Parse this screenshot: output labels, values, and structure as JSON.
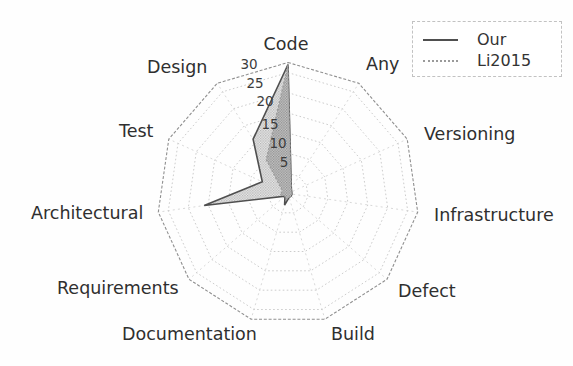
{
  "figure": {
    "background": "#fefefe"
  },
  "legend": {
    "items": [
      {
        "label": "Our",
        "line_style": "solid"
      },
      {
        "label": "Li2015",
        "line_style": "dotted"
      }
    ]
  },
  "chart_data": {
    "type": "radar",
    "title": "",
    "categories": [
      "Code",
      "Any",
      "Versioning",
      "Infrastructure",
      "Defect",
      "Build",
      "Documentation",
      "Requirements",
      "Architectural",
      "Test",
      "Design"
    ],
    "direction": "clockwise",
    "start_angle_deg": 90,
    "radial_ticks": [
      5,
      10,
      15,
      20,
      25,
      30
    ],
    "rmax": 32.5,
    "grid": true,
    "legend_position": "upper right",
    "series": [
      {
        "name": "Our",
        "style": "solid",
        "values": [
          32,
          1.5,
          1,
          1,
          1,
          1,
          3,
          1,
          21,
          7,
          16
        ]
      },
      {
        "name": "Li2015",
        "style": "dotted",
        "values": [
          32,
          1.5,
          1,
          1,
          1,
          1,
          1.5,
          1,
          2,
          1.5,
          10
        ]
      }
    ],
    "colors": {
      "our_line": "#4f4f4f",
      "li2015_line": "#9a9a9a",
      "fill_gray": "#9a9a9a",
      "grid_line": "#c6c6c6",
      "spoke_line": "#d4d4d4",
      "rim_line": "#8f8f8f",
      "label_text": "#2f2f2f",
      "tick_text": "#3c3c3c"
    }
  }
}
